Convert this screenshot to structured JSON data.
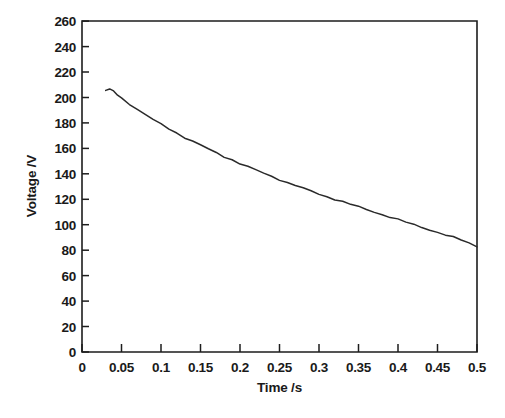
{
  "chart_data": {
    "type": "line",
    "title": "",
    "subtitle": "",
    "xlabel": "Time /s",
    "ylabel": "Voltage /V",
    "xlim": [
      0,
      0.5
    ],
    "ylim": [
      0,
      260
    ],
    "grid": false,
    "legend": false,
    "legend_position": "none",
    "x_ticks": [
      0,
      0.05,
      0.1,
      0.15,
      0.2,
      0.25,
      0.3,
      0.35,
      0.4,
      0.45,
      0.5
    ],
    "x_tick_labels": [
      "0",
      "0.05",
      "0.1",
      "0.15",
      "0.2",
      "0.25",
      "0.3",
      "0.35",
      "0.4",
      "0.45",
      "0.5"
    ],
    "y_ticks": [
      0,
      20,
      40,
      60,
      80,
      100,
      120,
      140,
      160,
      180,
      200,
      220,
      240,
      260
    ],
    "y_tick_labels": [
      "0",
      "20",
      "40",
      "60",
      "80",
      "100",
      "120",
      "140",
      "160",
      "180",
      "200",
      "220",
      "240",
      "260"
    ],
    "series": [
      {
        "name": "Voltage decay",
        "x": [
          0.03,
          0.035,
          0.04,
          0.045,
          0.05,
          0.06,
          0.07,
          0.08,
          0.09,
          0.1,
          0.11,
          0.12,
          0.13,
          0.14,
          0.15,
          0.16,
          0.17,
          0.18,
          0.19,
          0.2,
          0.21,
          0.22,
          0.23,
          0.24,
          0.25,
          0.26,
          0.27,
          0.28,
          0.29,
          0.3,
          0.31,
          0.32,
          0.33,
          0.34,
          0.35,
          0.36,
          0.37,
          0.38,
          0.39,
          0.4,
          0.41,
          0.42,
          0.43,
          0.44,
          0.45,
          0.46,
          0.47,
          0.48,
          0.49,
          0.5
        ],
        "y": [
          205.5,
          206.5,
          204.5,
          202.0,
          199.5,
          195.0,
          190.5,
          186.5,
          182.5,
          179.0,
          175.5,
          172.0,
          168.5,
          165.5,
          162.5,
          159.5,
          156.5,
          153.5,
          151.0,
          148.0,
          145.5,
          143.0,
          140.5,
          138.0,
          135.5,
          133.0,
          131.0,
          128.5,
          126.5,
          124.0,
          122.0,
          120.0,
          118.0,
          116.0,
          114.0,
          112.0,
          110.0,
          108.0,
          106.0,
          104.0,
          102.0,
          100.0,
          98.0,
          96.0,
          94.0,
          92.0,
          90.0,
          88.0,
          85.5,
          83.0
        ]
      }
    ],
    "annotations": []
  },
  "axes": {
    "x_title": "Time /s",
    "y_title": "Voltage /V"
  }
}
